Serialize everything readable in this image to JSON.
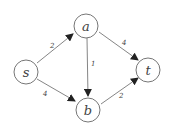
{
  "graph": {
    "nodes": [
      {
        "id": "s",
        "label": "s",
        "x": 26,
        "y": 72
      },
      {
        "id": "a",
        "label": "a",
        "x": 86,
        "y": 26
      },
      {
        "id": "b",
        "label": "b",
        "x": 88,
        "y": 110
      },
      {
        "id": "t",
        "label": "t",
        "x": 148,
        "y": 70
      }
    ],
    "edges": [
      {
        "from": "s",
        "to": "a",
        "weight": "2"
      },
      {
        "from": "s",
        "to": "b",
        "weight": "4"
      },
      {
        "from": "a",
        "to": "b",
        "weight": "1"
      },
      {
        "from": "a",
        "to": "t",
        "weight": "4"
      },
      {
        "from": "b",
        "to": "t",
        "weight": "2"
      }
    ]
  }
}
